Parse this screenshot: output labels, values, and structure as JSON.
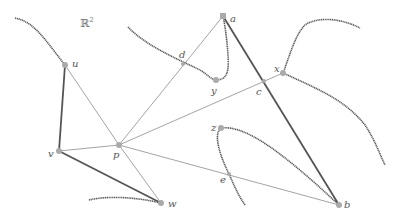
{
  "diagram": {
    "space_label": "ℝ²",
    "space_superscript": "2",
    "space_base": "ℝ",
    "colors": {
      "thin_edge": "#9a9a9a",
      "thick_edge": "#555555",
      "point": "#aaaaaa",
      "label": "#555555"
    },
    "points": {
      "a": {
        "label": "a"
      },
      "b": {
        "label": "b"
      },
      "c": {
        "label": "c"
      },
      "d": {
        "label": "d"
      },
      "e": {
        "label": "e"
      },
      "p": {
        "label": "p"
      },
      "u": {
        "label": "u"
      },
      "v": {
        "label": "v"
      },
      "w": {
        "label": "w"
      },
      "x": {
        "label": "x"
      },
      "y": {
        "label": "y"
      },
      "z": {
        "label": "z"
      }
    },
    "thin_edges": [
      [
        "p",
        "u"
      ],
      [
        "p",
        "a"
      ],
      [
        "p",
        "x"
      ],
      [
        "p",
        "b"
      ],
      [
        "p",
        "v"
      ],
      [
        "p",
        "w"
      ]
    ],
    "thick_edges": [
      [
        "u",
        "v"
      ],
      [
        "v",
        "w"
      ],
      [
        "a",
        "b"
      ],
      [
        "z",
        "b"
      ],
      [
        "x",
        "b-curve"
      ]
    ]
  }
}
